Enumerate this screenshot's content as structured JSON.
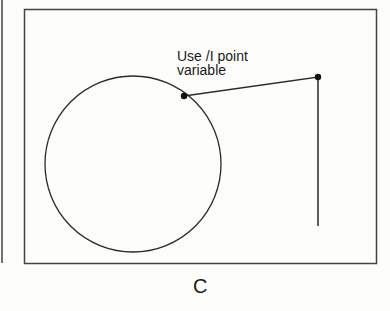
{
  "figure": {
    "annotation_line1": "Use /I point",
    "annotation_line2": "variable",
    "caption": "C"
  },
  "colors": {
    "stroke": "#2a2a2a",
    "background": "#fdfdfc"
  }
}
